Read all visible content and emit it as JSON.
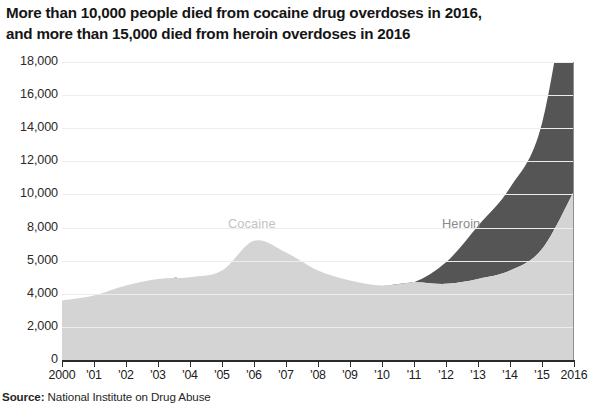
{
  "title": {
    "line1": "More than 10,000 people died from cocaine drug overdoses in 2016,",
    "line2": "and more than 15,000 died from heroin overdoses in 2016"
  },
  "source": {
    "prefix": "Source:",
    "text": " National Institute on Drug Abuse"
  },
  "colors": {
    "cocaine_fill": "#d4d4d4",
    "heroin_fill": "#555555",
    "axis": "#2b2b2b",
    "gridline": "#ededed",
    "title_text": "#151515",
    "cocaine_label_text": "#c3c3c3",
    "heroin_label_text": "#8a8a8a"
  },
  "chart_data": {
    "type": "area",
    "stacked": true,
    "title": "More than 10,000 people died from cocaine drug overdoses in 2016, and more than 15,000 died from heroin overdoses in 2016",
    "subtitle": "",
    "xlabel": "",
    "ylabel": "",
    "xlim": [
      2000,
      2016
    ],
    "ylim": [
      0,
      18000
    ],
    "grid": true,
    "legend_position": "inline-labels",
    "x": [
      2000,
      2001,
      2002,
      2003,
      2004,
      2005,
      2006,
      2007,
      2008,
      2009,
      2010,
      2011,
      2012,
      2013,
      2014,
      2015,
      2016
    ],
    "x_tick_labels": [
      "2000",
      "'01",
      "'02",
      "'03",
      "'04",
      "'05",
      "'06",
      "'07",
      "'08",
      "'09",
      "'10",
      "'11",
      "'12",
      "'13",
      "'14",
      "'15",
      "2016"
    ],
    "y_tick_values": [
      0,
      2000,
      4000,
      6000,
      8000,
      10000,
      12000,
      14000,
      16000,
      18000
    ],
    "y_tick_labels": [
      "0",
      "2,000",
      "4,000",
      "5,000",
      "8,000",
      "10,000",
      "12,000",
      "14,000",
      "16,000",
      "18,000"
    ],
    "series": [
      {
        "name": "Cocaine",
        "color": "#d4d4d4",
        "values": [
          3600,
          3900,
          4500,
          4900,
          5000,
          5400,
          7200,
          6500,
          5400,
          4800,
          4500,
          4700,
          4600,
          4900,
          5400,
          6700,
          10200
        ]
      },
      {
        "name": "Heroin",
        "color": "#555555",
        "values": [
          0,
          0,
          0,
          0,
          0,
          0,
          0,
          0,
          0,
          0,
          0,
          0,
          1300,
          3200,
          5000,
          7600,
          15100
        ],
        "note": "plotted stacked above cocaine; band emerges near 2011"
      }
    ],
    "annotations": [
      {
        "text": "Cocaine",
        "x": 2006,
        "y": 8200
      },
      {
        "text": "Heroin",
        "x": 2012.5,
        "y": 8200
      }
    ]
  }
}
